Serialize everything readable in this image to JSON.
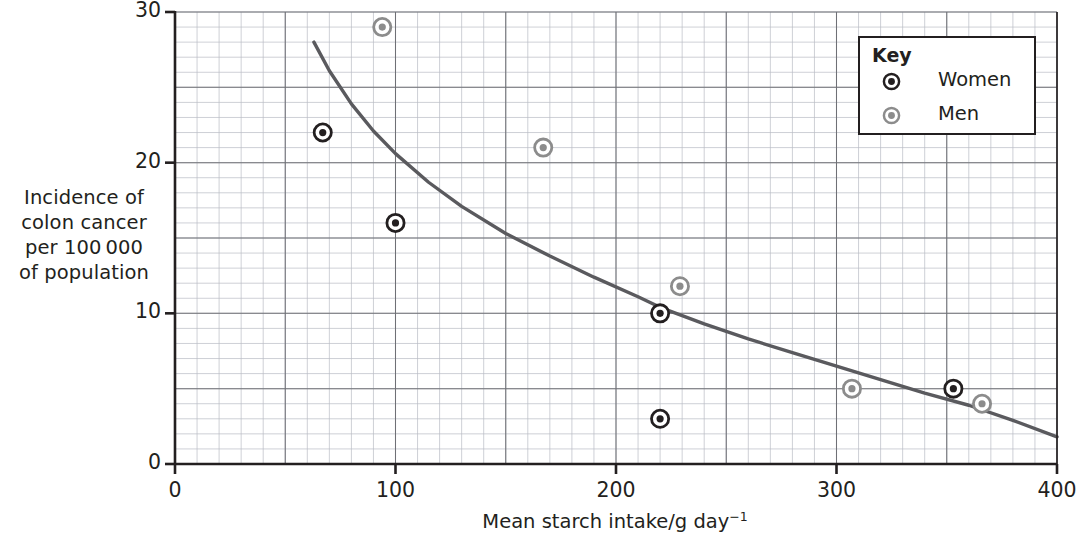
{
  "chart_data": {
    "type": "scatter",
    "title": "",
    "xlabel": "Mean starch intake/g day",
    "xlabel_sup": "−1",
    "ylabel_lines": [
      "Incidence of",
      "colon cancer",
      "per 100 000",
      "of population"
    ],
    "xlim": [
      0,
      400
    ],
    "ylim": [
      0,
      30
    ],
    "xticks": [
      0,
      100,
      200,
      300,
      400
    ],
    "xtick_labels": [
      "0",
      "100",
      "200",
      "300",
      "400"
    ],
    "yticks": [
      0,
      10,
      20,
      30
    ],
    "ytick_labels": [
      "0",
      "10",
      "20",
      "30"
    ],
    "x_minor_step": 10,
    "y_minor_step": 1,
    "grid": true,
    "grid_major_color": "#6f7076",
    "grid_minor_color": "#b9bcc4",
    "axis_color": "#231f20",
    "legend": {
      "title": "Key",
      "position": "top-right",
      "entries": [
        {
          "label": "Women",
          "marker": "target-circle",
          "color": "#231f20"
        },
        {
          "label": "Men",
          "marker": "target-circle",
          "color": "#8c8c8c"
        }
      ]
    },
    "series": [
      {
        "name": "Women",
        "marker_color": "#231f20",
        "points": [
          {
            "x": 67,
            "y": 22
          },
          {
            "x": 100,
            "y": 16
          },
          {
            "x": 220,
            "y": 10
          },
          {
            "x": 220,
            "y": 3
          },
          {
            "x": 353,
            "y": 5
          }
        ]
      },
      {
        "name": "Men",
        "marker_color": "#8c8c8c",
        "points": [
          {
            "x": 94,
            "y": 29
          },
          {
            "x": 167,
            "y": 21
          },
          {
            "x": 229,
            "y": 11.8
          },
          {
            "x": 307,
            "y": 5
          },
          {
            "x": 366,
            "y": 4
          }
        ]
      }
    ],
    "trend_curve": {
      "name": "fitted curve",
      "color": "#5a5a5e",
      "x_start": 63,
      "x_end": 400,
      "y_start": 28,
      "y_end": 1.8,
      "points": [
        {
          "x": 63,
          "y": 28.0
        },
        {
          "x": 70,
          "y": 26.1
        },
        {
          "x": 80,
          "y": 23.9
        },
        {
          "x": 90,
          "y": 22.1
        },
        {
          "x": 100,
          "y": 20.6
        },
        {
          "x": 115,
          "y": 18.7
        },
        {
          "x": 130,
          "y": 17.1
        },
        {
          "x": 150,
          "y": 15.3
        },
        {
          "x": 170,
          "y": 13.8
        },
        {
          "x": 190,
          "y": 12.4
        },
        {
          "x": 210,
          "y": 11.1
        },
        {
          "x": 220,
          "y": 10.4
        },
        {
          "x": 240,
          "y": 9.3
        },
        {
          "x": 260,
          "y": 8.3
        },
        {
          "x": 280,
          "y": 7.4
        },
        {
          "x": 300,
          "y": 6.5
        },
        {
          "x": 320,
          "y": 5.6
        },
        {
          "x": 340,
          "y": 4.7
        },
        {
          "x": 360,
          "y": 3.9
        },
        {
          "x": 380,
          "y": 2.9
        },
        {
          "x": 400,
          "y": 1.8
        }
      ]
    }
  }
}
